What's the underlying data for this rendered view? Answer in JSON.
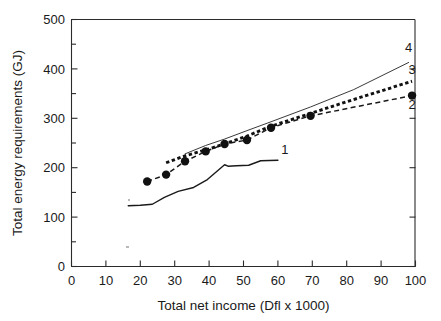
{
  "chart_data": {
    "type": "line",
    "title": "",
    "subtitle": "",
    "xlabel": "Total net income (Dfl x 1000)",
    "ylabel": "Total energy requirements (GJ)",
    "xlim": [
      0,
      100
    ],
    "ylim": [
      0,
      500
    ],
    "xticks": [
      0,
      10,
      20,
      30,
      40,
      50,
      60,
      70,
      80,
      90,
      100
    ],
    "yticks": [
      0,
      100,
      200,
      300,
      400,
      500
    ],
    "xtick_labels": [
      "0",
      "10",
      "20",
      "30",
      "40",
      "50",
      "60",
      "70",
      "80",
      "90",
      "100"
    ],
    "ytick_labels": [
      "0",
      "100",
      "200",
      "300",
      "400",
      "500"
    ],
    "x_minor_ticks": [],
    "y_minor_ticks": [
      50,
      150,
      250,
      350,
      450
    ],
    "grid": false,
    "legend_position": "inline-right-end-labels",
    "annotations": [
      {
        "text": "4",
        "x": 98,
        "y": 435,
        "series": "4"
      },
      {
        "text": "3",
        "x": 99,
        "y": 390,
        "series": "3"
      },
      {
        "text": "2",
        "x": 99,
        "y": 318,
        "series": "2"
      },
      {
        "text": "1",
        "x": 62,
        "y": 228,
        "series": "1"
      }
    ],
    "series": [
      {
        "name": "1",
        "label": "1",
        "style": "solid-thin",
        "markers": false,
        "x": [
          16.5,
          20.0,
          23.5,
          27.0,
          31.0,
          35.5,
          39.5,
          44.5,
          45.5,
          48.0,
          51.5,
          55.0,
          60.0
        ],
        "values": [
          123,
          124,
          126,
          140,
          152,
          160,
          176,
          206,
          203,
          204,
          205,
          214,
          215
        ]
      },
      {
        "name": "2",
        "label": "2",
        "style": "dashed-with-markers",
        "markers": true,
        "x": [
          22.0,
          27.5,
          33.0,
          39.0,
          44.5,
          51.0,
          58.0,
          69.5,
          99.0
        ],
        "values": [
          172,
          186,
          213,
          233,
          248,
          256,
          281,
          305,
          346
        ]
      },
      {
        "name": "3",
        "label": "3",
        "style": "dotted-thick",
        "markers": false,
        "x": [
          27.5,
          33.0,
          39.0,
          44.5,
          51.0,
          58.0,
          69.5,
          82.0,
          99.0
        ],
        "values": [
          210,
          224,
          236,
          248,
          264,
          284,
          310,
          338,
          375
        ]
      },
      {
        "name": "4",
        "label": "4",
        "style": "solid-thin",
        "markers": false,
        "x": [
          33.0,
          39.0,
          44.5,
          51.0,
          58.0,
          69.5,
          82.0,
          98.0
        ],
        "values": [
          228,
          245,
          258,
          275,
          293,
          323,
          358,
          413
        ]
      }
    ]
  }
}
